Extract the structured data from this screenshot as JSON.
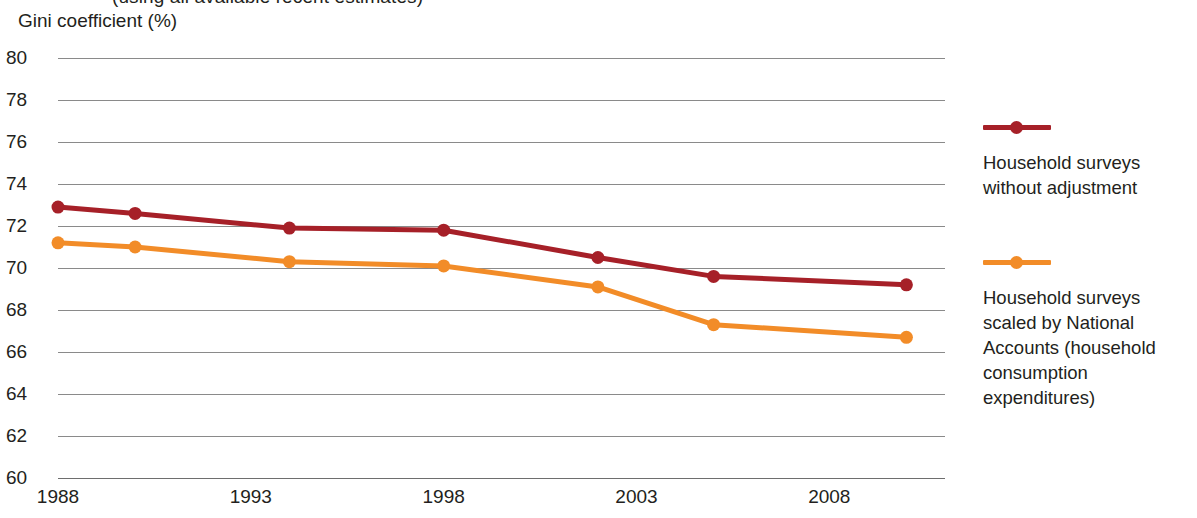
{
  "header": {
    "clipped_title": "(using all available recent estimates)",
    "y_axis_caption": "Gini coefficient (%)"
  },
  "legend": {
    "entries": [
      {
        "swatch_name": "legend-swatch-household-surveys",
        "color": "#A62028",
        "label": "Household surveys without adjustment"
      },
      {
        "swatch_name": "legend-swatch-national-accounts",
        "color": "#F28C28",
        "label": "Household surveys scaled by National Accounts (household consumption expenditures)"
      }
    ]
  },
  "chart_data": {
    "type": "line",
    "title": "(using all available recent estimates)",
    "xlabel": "",
    "ylabel": "Gini coefficient (%)",
    "ylim": [
      60,
      80
    ],
    "xlim": [
      1988,
      2011
    ],
    "ytick_labels": [
      "80",
      "78",
      "76",
      "74",
      "72",
      "70",
      "68",
      "66",
      "64",
      "62",
      "60"
    ],
    "ytick_values": [
      80,
      78,
      76,
      74,
      72,
      70,
      68,
      66,
      64,
      62,
      60
    ],
    "xtick_labels": [
      "1988",
      "1993",
      "1998",
      "2003",
      "2008"
    ],
    "xtick_values": [
      1988,
      1993,
      1998,
      2003,
      2008
    ],
    "grid": true,
    "legend_position": "right",
    "x": [
      1988,
      1990,
      1994,
      1998,
      2002,
      2005,
      2010
    ],
    "series": [
      {
        "name": "Household surveys without adjustment",
        "color": "#A62028",
        "values": [
          72.9,
          72.6,
          71.9,
          71.8,
          70.5,
          69.6,
          69.2
        ]
      },
      {
        "name": "Household surveys scaled by National Accounts (household consumption expenditures)",
        "color": "#F28C28",
        "values": [
          71.2,
          71.0,
          70.3,
          70.1,
          69.1,
          67.3,
          66.7
        ]
      }
    ]
  }
}
